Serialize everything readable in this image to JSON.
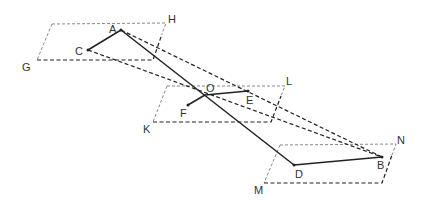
{
  "diagram": {
    "type": "geometry-parallel-planes",
    "planes": [
      {
        "name": "plane-top",
        "corner_labels": [
          "G",
          "H"
        ]
      },
      {
        "name": "plane-middle",
        "corner_labels": [
          "K",
          "L"
        ]
      },
      {
        "name": "plane-bottom",
        "corner_labels": [
          "M",
          "N"
        ]
      }
    ],
    "points": {
      "A": "A",
      "B": "B",
      "C": "C",
      "D": "D",
      "E": "E",
      "F": "F",
      "O": "O",
      "G": "G",
      "H": "H",
      "K": "K",
      "L": "L",
      "M": "M",
      "N": "N"
    },
    "segments_solid": [
      "AC",
      "AD",
      "DB",
      "OE",
      "OF"
    ],
    "segments_dashed": [
      "CB",
      "AB",
      "plane edges"
    ]
  }
}
